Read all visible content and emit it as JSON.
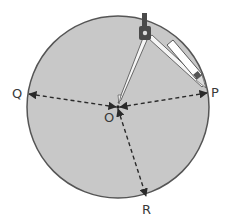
{
  "diagram": {
    "title": "",
    "shape": "circle",
    "center_label": "O",
    "points": [
      {
        "label": "Q",
        "role": "point on circle"
      },
      {
        "label": "P",
        "role": "point on circle"
      },
      {
        "label": "R",
        "role": "point on circle"
      }
    ],
    "radii": [
      "OQ",
      "OP",
      "OR"
    ],
    "tool": "compass",
    "colors": {
      "fill": "#c8c8c8",
      "outline": "#555555",
      "lines": "#2a2a2a",
      "compass": "#4a4a4a"
    }
  }
}
